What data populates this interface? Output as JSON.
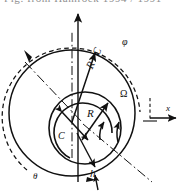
{
  "figure": {
    "background_color": "#ffffff",
    "ink_color": "#111111",
    "width": 184,
    "height": 195,
    "cropped_header_text": "Fig. from Hamrock 1994 / 1991",
    "labels": {
      "radius": "R",
      "radius_plus_clearance": "R+C",
      "clearance": "C",
      "film_thickness": "h",
      "angular_velocity": "Ω",
      "attitude_angle": "φ",
      "circumferential_angle": "θ",
      "x_axis": "x"
    },
    "geometry": {
      "outer_circle": {
        "cx": 72,
        "cy": 113,
        "r": 63,
        "style": "solid",
        "name": "bearing-bore"
      },
      "inner_circle": {
        "cx": 85,
        "cy": 128,
        "r": 36,
        "style": "solid",
        "name": "journal-shaft"
      },
      "outer_dashed_arc": {
        "cx": 72,
        "cy": 113,
        "r": 69,
        "style": "dashed",
        "name": "attitude-angle-arc"
      },
      "omega_arc": {
        "cx": 85,
        "cy": 128,
        "r": 29,
        "style": "solid",
        "name": "rotation-arc"
      }
    },
    "annotations": [
      {
        "name": "vertical-load-axis",
        "style": "solid-arrow",
        "direction": "up"
      },
      {
        "name": "radius-plus-clearance-arrow",
        "style": "solid-arrow",
        "direction": "up-right"
      },
      {
        "name": "radius-arrow",
        "style": "solid-arrow",
        "direction": "up-right"
      },
      {
        "name": "clearance-double-arrow",
        "style": "double-arrow",
        "direction": "diagonal"
      },
      {
        "name": "film-thickness-arrow",
        "style": "solid-arrow",
        "direction": "down"
      },
      {
        "name": "rotation-arrows",
        "style": "curved-arrow",
        "direction": "counterclockwise"
      },
      {
        "name": "attitude-arc-arrow",
        "style": "dashed-arc-arrow",
        "direction": "counterclockwise"
      },
      {
        "name": "x-axis-arrow",
        "style": "solid-arrow",
        "direction": "right"
      },
      {
        "name": "centerline-upper-left",
        "style": "dash-dot"
      },
      {
        "name": "centerline-lower-right",
        "style": "dash-dot"
      },
      {
        "name": "vertical-centerline",
        "style": "dash-dot"
      }
    ]
  }
}
